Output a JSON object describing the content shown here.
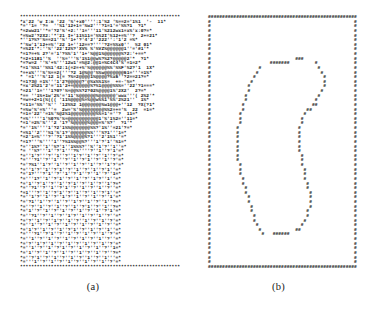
{
  "figure": {
    "panels": [
      {
        "id": "a",
        "caption": "(a)",
        "kind": "ascii-density-map",
        "border_char": "*",
        "rows": [
          "*********************************************************",
          "*x'22 'w I:m '22 '%'+x0'''':1'%2 '%==2='1%1  '-  11*",
          "*=''1= '?=  ''%1'12+1='%w2'''?1=1'='%%?1  ?1*",
          "*=2ww21''*='?2'%'+2:''1='''11'%212wx1=x%'x:0?=*",
          "*=%w2'?2X2:'*'21 I+'11%11='%%2I'%12+=%''?  2+=21*",
          "*''1?%?'%==21''%''1+'?'4'2''222'':'1'2 =%*",
          "*'%w'1'12+=%''22 1+''12==?''''?2=%%x0''  %2 01*",
          "*=%2I'*:''%''22'I2%?'XV% %'%VZ%@@@@@@1''='#1'*",
          "*=1?=+% 2?'='1'?%%'1''1+'%@@1%@@@@@@%?2:'+==*",
          "*=2+1181''%  ''%='''%'1%1@@w%?%2?@@@@@2'*  ?1*",
          "*=?w=2 ''%'+%'''12w1'=%@2:@@1=%C4C4'%'=1=2*",
          "*=1'%%1''%%1'42:1(=2=+%'%@@@@@@%%'%%F'%2?'1  1X*",
          "*=+x%'''%'%==2('''?2 1@%@@'%%w@@@@@@@61='''=1%*",
          "* '=1'''%'12 1(= ?%=2@@@@1%@@@@?%x6''?2==21?=*",
          "*=1?3@ =1%'''1'2?@@@@@?'@%x%%1%=  +=-'%=*",
          "*=x'2%21'2'='11'2+=@@@@@@%?%1@@@@%%%=''22'?1===*",
          "*=21''1='''1?0?'%=@@%%?2?02%@@@@1%'2X2'  2?=*",
          "*== ''1%+1w'2%'='11'%@@@@@@%@@@@@@'wwx'''( 2%2'*",
          "*=w=+2+1(%((( '11%@@@@%=%@@w%%1'%%'2%21''  1%*",
          "*=11='%%''%'' '12%%2 1@@@@@@@%w1@@@+''12  ?X(?1*",
          "*=%w'%'=%'''=  2w='%'%@@@@@@@@%%2=+='%  22  =1=*",
          "*=1='22''=1%'%@2%1@@@@@@@@@%%=1'=''?  11=*",
          "*=%'''''1'%0?%'%=@@@@@@@@@@@1'%'1%2=''11=*",
          "*=1'=2%'%'''2 '1?'%@@@@@%@@@=%'%?'  ?1'*",
          "*=''1%''''1'?2'1%%@@@@@@@%%?'1%''=21'?=*",
          "*=%1''2'''%1'%'1?'@@@@@@%%'''%?1'''1=*",
          "*=2'1=%'''?''?1'1%%@@@@%?1'''2'1%1''=*",
          "*=1?'''%''''1''?%1%%@@%?'''1'?'1''%1=*",
          "*=''1%?''1''%?'1''1%%%?''%''1'?''1''=*",
          "*= ''%?'''1''?'1'''?%''''?''1''?'1'=*",
          "*=''1'?'''?''1''?''1'?''1''?''1''?'=*",
          "*='''?1''?''1'''?''1''?'1''?''1''?'=*",
          "*='?%1''1'?''1''?''1''?''1''?''1'?'=*",
          "*=''1'?''1''?'1''?''1''?''1''?'1''=*",
          "*='1?'''?'1''?''1''?'1''?''1''?''1=*",
          "*='''1?''1''?'1''?''1''?''1'?''1''=*",
          "*='1''?'1''?''1''?'1''?''1''?''1'?=*",
          "*=''?1''?''1''?'1''?''1''?''1''?''=*",
          "*=1'''?''1''?'1''?''1''?''1''?'1''=*",
          "*=''1'?''1''?''1'?''1''?''1''?''1'=*",
          "*='?1''1''?''1''?''1'?''1''?''1''?=*",
          "*=''?''1''?''1''?''1''?'1''?''1''?=*",
          "*='1''?''1''?''1''?''1''?''1''?'1'=*",
          "*=''?1''?''1''?''1'?''1''?''1''?''=*",
          "*='?''1''?''1'?''1''?''1''?''1''?'=*",
          "*=''1''?''1''?''1''?''1''?''1''?''=*",
          "*='1'?''1''?''1''?'1''?''1''?''1''=*",
          "*='''?1''?'1''?''1''?''1''?''1''?'=*",
          "*=''1''?''1''?''1''?''1''?''1''?''=*",
          "*='?''1'?''1''?''1''?''1''?''1''?'=*",
          "*=''1''?''1''?'1''?''1''?''1''?''1=*",
          "*='1''?''1''?''1''?''1''?''1''?''?=*",
          "*=''?'1''?''1''?''1''?''1''?''1'''=*",
          "*='''1''?''1''?''1''?''1''?''1''?'=*",
          "*********************************************************"
        ]
      },
      {
        "id": "b",
        "caption": "(b)",
        "kind": "ascii-contour-map",
        "border_char": "#",
        "rows": [
          "#####################################################",
          "#                                                   #",
          "#                                                   #",
          "#                                                   #",
          "#                                                   #",
          "#                                                   #",
          "#                                                   #",
          "#                                                   #",
          "#                                                   #",
          "#                              ###                  #",
          "#                     #######         #             #",
          "#                 #                    #            #",
          "#                #                      #           #",
          "#               #                        #          #",
          "#              #                         #          #",
          "#             #                          #          #",
          "#             #                         #           #",
          "#            #                         #            #",
          "#            #                        #             #",
          "#           #                        ##             #",
          "#           #                      ##               #",
          "#          #                      #                 #",
          "#          #                     #                  #",
          "#          #                     #                  #",
          "#         #                     #                   #",
          "#         #                     #                   #",
          "#         #                     #                   #",
          "#         #                     #                   #",
          "#         #                     #                   #",
          "#         #                     #                   #",
          "#         #                      #                  #",
          "#         #                      #                  #",
          "#          #                     #                  #",
          "#          #                      #                 #",
          "#          #                      #                 #",
          "#           #                     #                 #",
          "#           #                      #                #",
          "#            #                     #                #",
          "#            #                      #               #",
          "#             #                     #               #",
          "#             #                     #               #",
          "#              #                    #               #",
          "#              #                   #                #",
          "#               #                  #                #",
          "#               #                 #                 #",
          "#                #               #                  #",
          "#                 #            ##                   #",
          "#                  #   ######                       #",
          "#                                                   #",
          "#                                                   #",
          "#                                                   #",
          "#                                                   #",
          "#                                                   #",
          "#                                                   #",
          "#####################################################"
        ]
      }
    ]
  }
}
